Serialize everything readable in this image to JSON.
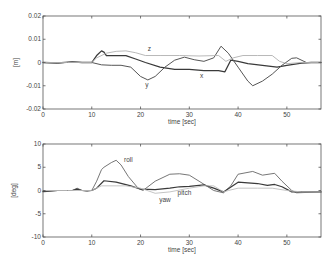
{
  "chart_data": [
    {
      "type": "line",
      "title": "",
      "xlabel": "time [sec]",
      "ylabel": "[m]",
      "xlim": [
        0,
        57
      ],
      "ylim": [
        -0.02,
        0.02
      ],
      "xticks": [
        0,
        10,
        20,
        30,
        40,
        50
      ],
      "xtick_labels": [
        "0",
        "10",
        "20",
        "30",
        "40",
        "50"
      ],
      "yticks": [
        -0.02,
        -0.01,
        0,
        0.01,
        0.02
      ],
      "ytick_labels": [
        "-0.02",
        "-0.01",
        "0",
        "0.01",
        "0.02"
      ],
      "grid": false,
      "legend": "inline-labels",
      "series": [
        {
          "name": "x",
          "color": "#3a3a3a",
          "label_at": [
            32.5,
            -0.0068
          ],
          "x": [
            0,
            3,
            6,
            8,
            10,
            11,
            12,
            12.5,
            13,
            15,
            17,
            19,
            21,
            24,
            27,
            30,
            33,
            36,
            37.3,
            38.5,
            40,
            42,
            45,
            48,
            50,
            53,
            55,
            57
          ],
          "y": [
            0,
            -0.0002,
            0.0003,
            0,
            0,
            0.003,
            0.005,
            0.0045,
            0.003,
            0.003,
            0.003,
            0.0015,
            0,
            -0.002,
            -0.003,
            -0.003,
            -0.0035,
            -0.0035,
            -0.004,
            0.001,
            0.0005,
            -0.0005,
            -0.0012,
            -0.002,
            -0.0012,
            -0.0003,
            0,
            0
          ]
        },
        {
          "name": "y",
          "color": "#555555",
          "label_at": [
            21.3,
            -0.0105
          ],
          "x": [
            0,
            3,
            6,
            8,
            10,
            12,
            14,
            16,
            18,
            20,
            21.5,
            23,
            25,
            27,
            29,
            31,
            33,
            35,
            36.5,
            38,
            40,
            42,
            43,
            45,
            47,
            49,
            51,
            52,
            54,
            57
          ],
          "y": [
            0,
            -0.0003,
            0.0002,
            0,
            0,
            -0.001,
            -0.0012,
            -0.0012,
            -0.002,
            -0.006,
            -0.0075,
            -0.006,
            -0.002,
            0.001,
            0.0023,
            0.0012,
            0.0005,
            0.002,
            0.007,
            0.004,
            -0.002,
            -0.008,
            -0.01,
            -0.008,
            -0.005,
            -0.0012,
            0.0018,
            0.002,
            0,
            0
          ]
        },
        {
          "name": "z",
          "color": "#b0b0b0",
          "label_at": [
            21.8,
            0.005
          ],
          "x": [
            0,
            5,
            10,
            11,
            13,
            15,
            17,
            19,
            21,
            24,
            28,
            32,
            36,
            37.5,
            39,
            41,
            44,
            47,
            48.5,
            50,
            53,
            57
          ],
          "y": [
            0,
            0,
            0,
            0.002,
            0.004,
            0.0048,
            0.005,
            0.0042,
            0.003,
            0.003,
            0.003,
            0.0028,
            0.003,
            0.0005,
            0.002,
            0.003,
            0.003,
            0.003,
            0.0005,
            -0.0005,
            0,
            0
          ]
        }
      ]
    },
    {
      "type": "line",
      "title": "",
      "xlabel": "time [sec]",
      "ylabel": "[deg]",
      "xlim": [
        0,
        57
      ],
      "ylim": [
        -10,
        10
      ],
      "xticks": [
        0,
        10,
        20,
        30,
        40,
        50
      ],
      "xtick_labels": [
        "0",
        "10",
        "20",
        "30",
        "40",
        "50"
      ],
      "yticks": [
        -10,
        -5,
        0,
        5,
        10
      ],
      "ytick_labels": [
        "-10",
        "-5",
        "0",
        "5",
        "10"
      ],
      "grid": false,
      "legend": "inline-labels",
      "series": [
        {
          "name": "roll",
          "color": "#666666",
          "label_at": [
            17.5,
            6.2
          ],
          "x": [
            0,
            3,
            6,
            7,
            8,
            9,
            10,
            11,
            12,
            12.5,
            14,
            15,
            16,
            17.5,
            19.5,
            20.5,
            23,
            26,
            28,
            30,
            32,
            33.5,
            35,
            37,
            38.5,
            40,
            43,
            45,
            47.5,
            49,
            51,
            52,
            57
          ],
          "y": [
            -0.3,
            0,
            0,
            0.5,
            0,
            -0.2,
            0,
            2,
            4.5,
            5,
            6,
            6.5,
            5.5,
            3,
            0.5,
            0,
            2,
            3.5,
            3.6,
            3.3,
            2,
            1,
            0,
            -0.5,
            1,
            3.5,
            4.1,
            3.3,
            3.7,
            2,
            0,
            -0.5,
            -0.3
          ]
        },
        {
          "name": "pitch",
          "color": "#3a3a3a",
          "label_at": [
            29,
            -1
          ],
          "x": [
            0,
            3,
            6,
            7,
            8,
            10,
            11,
            12.5,
            15,
            18,
            20,
            23,
            26,
            28,
            30,
            33,
            35,
            37,
            38,
            40,
            44,
            46,
            47.5,
            49,
            51,
            57
          ],
          "y": [
            -0.2,
            0,
            0,
            0.3,
            0,
            0,
            0.5,
            2.1,
            1.8,
            1,
            0.3,
            0.2,
            0.5,
            0.8,
            0.9,
            1.2,
            0.5,
            -0.3,
            0.4,
            1.8,
            1.5,
            1.1,
            1.3,
            0.8,
            -0.3,
            -0.3
          ]
        },
        {
          "name": "yaw",
          "color": "#bdbdbd",
          "label_at": [
            25,
            -2.5
          ],
          "x": [
            0,
            5,
            10,
            12,
            15,
            17,
            20,
            23,
            26,
            30,
            33,
            35,
            37,
            38,
            40,
            44,
            47,
            50,
            53,
            57
          ],
          "y": [
            0,
            0,
            0,
            1,
            1,
            1,
            0.5,
            -0.6,
            -0.3,
            0.5,
            1,
            1,
            -0.3,
            0,
            0.5,
            0.5,
            0.5,
            0,
            -0.3,
            -0.3
          ]
        }
      ]
    }
  ]
}
